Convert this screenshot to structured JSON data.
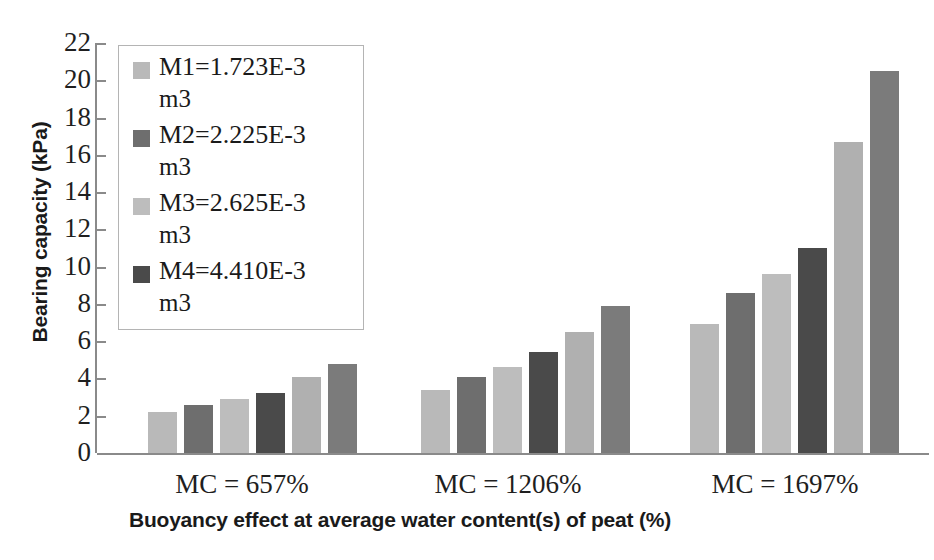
{
  "chart_data": {
    "type": "bar",
    "title": "",
    "xlabel": "Buoyancy effect at average water content(s) of peat (%)",
    "ylabel": "Bearing capacity (kPa)",
    "ylim": [
      0,
      22
    ],
    "ytick_step": 2,
    "yticks": [
      22,
      20,
      18,
      16,
      14,
      12,
      10,
      8,
      6,
      4,
      2,
      0
    ],
    "grid": false,
    "legend_position": "upper-left-inside",
    "categories": [
      "MC = 657%",
      "MC = 1206%",
      "MC = 1697%"
    ],
    "series": [
      {
        "name": "M1=1.723E-3 m3",
        "label_main": "M1=1.723E-3",
        "label_unit": "m3",
        "color": "#b9b9b9",
        "values": [
          2.2,
          3.4,
          6.9
        ],
        "in_legend": true
      },
      {
        "name": "M2=2.225E-3 m3",
        "label_main": "M2=2.225E-3",
        "label_unit": "m3",
        "color": "#6e6e6e",
        "values": [
          2.6,
          4.1,
          8.6
        ],
        "in_legend": true
      },
      {
        "name": "M3=2.625E-3 m3",
        "label_main": "M3=2.625E-3",
        "label_unit": "m3",
        "color": "#bdbdbd",
        "values": [
          2.9,
          4.6,
          9.6
        ],
        "in_legend": true
      },
      {
        "name": "M4=4.410E-3 m3",
        "label_main": "M4=4.410E-3",
        "label_unit": "m3",
        "color": "#4a4a4a",
        "values": [
          3.2,
          5.4,
          11.0
        ],
        "in_legend": true
      },
      {
        "name": "series-5",
        "label_main": "",
        "label_unit": "",
        "color": "#b0b0b0",
        "values": [
          4.1,
          6.5,
          16.7
        ],
        "in_legend": false
      },
      {
        "name": "series-6",
        "label_main": "",
        "label_unit": "",
        "color": "#7b7b7b",
        "values": [
          4.8,
          7.9,
          20.5
        ],
        "in_legend": false
      }
    ]
  },
  "legend": {
    "items": [
      {
        "label_main": "M1=1.723E-3",
        "label_unit": "m3",
        "color": "#b9b9b9"
      },
      {
        "label_main": "M2=2.225E-3",
        "label_unit": "m3",
        "color": "#6e6e6e"
      },
      {
        "label_main": "M3=2.625E-3",
        "label_unit": "m3",
        "color": "#bdbdbd"
      },
      {
        "label_main": "M4=4.410E-3",
        "label_unit": "m3",
        "color": "#4a4a4a"
      }
    ]
  },
  "axis": {
    "y_title": "Bearing capacity (kPa)",
    "x_title": "Buoyancy effect at average water content(s) of peat (%)"
  },
  "colors": {
    "axis_line": "#8a8a8a",
    "text": "#1f1f1f",
    "background": "#ffffff"
  }
}
